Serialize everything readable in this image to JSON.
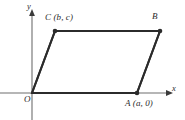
{
  "figure": {
    "background_color": "#ffffff",
    "stroke_color": "#2b2b2b",
    "axis_color": "#3a3a3a",
    "labels": {
      "vertex_C": "C (b, c)",
      "vertex_B": "B",
      "vertex_A": "A (a, 0)",
      "origin": "O",
      "x_axis": "x",
      "y_axis": "y"
    },
    "vertices": [
      {
        "name": "O",
        "label": "O",
        "x": 32,
        "y": 93
      },
      {
        "name": "A",
        "label": "A (a, 0)",
        "x": 137,
        "y": 93
      },
      {
        "name": "B",
        "label": "B",
        "x": 160,
        "y": 31
      },
      {
        "name": "C",
        "label": "C (b, c)",
        "x": 55,
        "y": 31
      }
    ],
    "edges": [
      {
        "from": "O",
        "to": "A"
      },
      {
        "from": "A",
        "to": "B"
      },
      {
        "from": "B",
        "to": "C"
      },
      {
        "from": "C",
        "to": "O"
      }
    ],
    "axes": {
      "x_axis": {
        "x1": 0,
        "y1": 93,
        "x2": 170,
        "y2": 93,
        "arrow": "right"
      },
      "y_axis": {
        "x1": 32,
        "y1": 120,
        "x2": 32,
        "y2": 12,
        "arrow": "up"
      }
    }
  }
}
